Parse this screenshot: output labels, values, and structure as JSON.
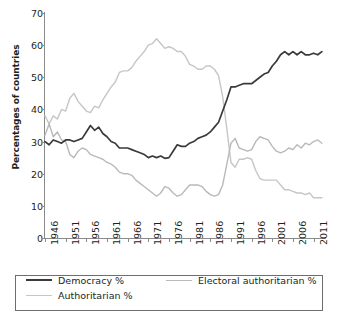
{
  "chart_data": {
    "type": "line",
    "title": "",
    "xlabel": "",
    "ylabel": "Percentages of countries",
    "xlim": [
      1946,
      2014
    ],
    "ylim": [
      0,
      70
    ],
    "ytick_labels": [
      "70",
      "60",
      "50",
      "40",
      "30",
      "20",
      "10",
      "0"
    ],
    "ytick_values": [
      70,
      60,
      50,
      40,
      30,
      20,
      10,
      0
    ],
    "xtick_labels": [
      "1946",
      "1951",
      "1956",
      "1961",
      "1966",
      "1971",
      "1976",
      "1981",
      "1986",
      "1991",
      "1996",
      "2001",
      "2006",
      "2011"
    ],
    "xtick_values": [
      1946,
      1951,
      1956,
      1961,
      1966,
      1971,
      1976,
      1981,
      1986,
      1991,
      1996,
      2001,
      2006,
      2011
    ],
    "grid": false,
    "legend_position": "bottom",
    "x": [
      1946,
      1947,
      1948,
      1949,
      1950,
      1951,
      1952,
      1953,
      1954,
      1955,
      1956,
      1957,
      1958,
      1959,
      1960,
      1961,
      1962,
      1963,
      1964,
      1965,
      1966,
      1967,
      1968,
      1969,
      1970,
      1971,
      1972,
      1973,
      1974,
      1975,
      1976,
      1977,
      1978,
      1979,
      1980,
      1981,
      1982,
      1983,
      1984,
      1985,
      1986,
      1987,
      1988,
      1989,
      1990,
      1991,
      1992,
      1993,
      1994,
      1995,
      1996,
      1997,
      1998,
      1999,
      2000,
      2001,
      2002,
      2003,
      2004,
      2005,
      2006,
      2007,
      2008,
      2009,
      2010,
      2011,
      2012,
      2013
    ],
    "series": [
      {
        "name": "Democracy %",
        "color": "#3a3a3a",
        "values": [
          30.0,
          29.0,
          30.5,
          30.0,
          29.5,
          30.5,
          30.5,
          30.0,
          30.5,
          31.0,
          33.0,
          35.0,
          33.5,
          34.5,
          32.5,
          31.5,
          30.0,
          29.5,
          28.0,
          28.0,
          28.0,
          27.5,
          27.0,
          26.5,
          26.0,
          25.0,
          25.5,
          25.0,
          25.5,
          24.8,
          25.0,
          27.0,
          29.0,
          28.5,
          28.5,
          29.5,
          30.0,
          31.0,
          31.5,
          32.0,
          33.0,
          34.5,
          36.0,
          39.5,
          43.0,
          47.0,
          47.0,
          47.5,
          48.0,
          48.0,
          48.0,
          49.0,
          50.0,
          51.0,
          51.5,
          53.5,
          55.0,
          57.0,
          58.0,
          57.0,
          58.0,
          57.0,
          58.0,
          57.0,
          57.0,
          57.5,
          57.0,
          58.0
        ]
      },
      {
        "name": "Electoral authoritarian %",
        "color": "#b9b9b9",
        "values": [
          32.0,
          35.5,
          31.5,
          33.0,
          30.5,
          30.0,
          26.0,
          25.0,
          27.0,
          28.0,
          27.5,
          26.0,
          25.5,
          25.0,
          24.5,
          23.5,
          23.0,
          22.0,
          20.5,
          20.0,
          20.0,
          19.5,
          18.0,
          17.0,
          16.0,
          15.0,
          14.0,
          13.0,
          14.0,
          16.0,
          15.5,
          14.0,
          13.0,
          13.5,
          15.0,
          16.5,
          16.5,
          16.5,
          16.0,
          14.5,
          13.5,
          13.0,
          13.5,
          16.5,
          23.0,
          29.5,
          31.0,
          28.0,
          27.5,
          27.0,
          27.5,
          30.0,
          31.5,
          31.0,
          30.5,
          28.5,
          27.0,
          26.5,
          27.0,
          28.0,
          27.5,
          29.0,
          28.0,
          29.5,
          29.0,
          30.0,
          30.5,
          29.5
        ]
      },
      {
        "name": "Authoritarian %",
        "color": "#c6c6c6",
        "values": [
          38.0,
          35.5,
          38.0,
          37.0,
          40.0,
          39.5,
          43.5,
          45.0,
          42.5,
          41.0,
          39.5,
          39.0,
          41.0,
          40.5,
          43.0,
          45.0,
          47.0,
          48.5,
          51.5,
          52.0,
          52.0,
          53.0,
          55.0,
          56.5,
          58.0,
          60.0,
          60.5,
          62.0,
          60.5,
          59.0,
          59.5,
          59.0,
          58.0,
          58.0,
          56.5,
          54.0,
          53.5,
          52.5,
          52.5,
          53.5,
          53.5,
          52.5,
          50.5,
          44.0,
          34.0,
          23.5,
          22.0,
          24.5,
          24.5,
          25.0,
          24.5,
          21.0,
          18.5,
          18.0,
          18.0,
          18.0,
          18.0,
          16.5,
          15.0,
          15.0,
          14.5,
          14.0,
          14.0,
          13.5,
          14.0,
          12.5,
          12.5,
          12.5
        ]
      }
    ]
  },
  "legend": {
    "items": [
      {
        "label": "Democracy %",
        "color": "#3a3a3a"
      },
      {
        "label": "Electoral authoritarian %",
        "color": "#b9b9b9"
      },
      {
        "label": "Authoritarian %",
        "color": "#c6c6c6"
      }
    ]
  },
  "axis": {
    "line_color": "#8a8a8a",
    "text_color": "#231f20"
  }
}
